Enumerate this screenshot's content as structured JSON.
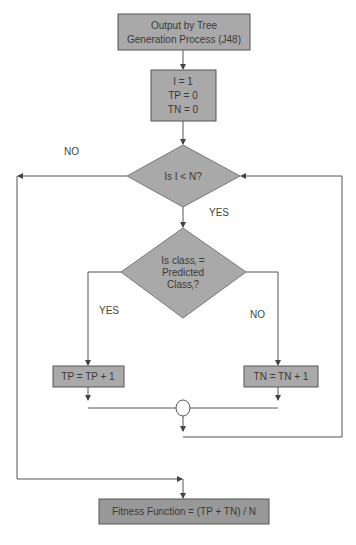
{
  "diagram": {
    "type": "flowchart",
    "colors": {
      "box_fill": "#a9a9a9",
      "box_stroke": "#555555",
      "line": "#555555",
      "text": "#3a3a3a",
      "background": "#ffffff"
    },
    "nodes": {
      "start": {
        "shape": "rectangle",
        "lines": [
          "Output by Tree",
          "Generation Process (J48)"
        ]
      },
      "init": {
        "shape": "rectangle",
        "lines": [
          "I = 1",
          "TP = 0",
          "TN = 0"
        ]
      },
      "loop_check": {
        "shape": "diamond",
        "text": "Is I < N?"
      },
      "class_check": {
        "shape": "diamond",
        "line1_main": "Is class",
        "line1_sub": "i",
        "line1_tail": " =",
        "line2": "Predicted",
        "line3_main": "Class",
        "line3_sub": "i",
        "line3_tail": "?"
      },
      "tp_increment": {
        "shape": "rectangle",
        "text": "TP = TP + 1"
      },
      "tn_increment": {
        "shape": "rectangle",
        "text": "TN = TN + 1"
      },
      "merge": {
        "shape": "circle",
        "text": ""
      },
      "fitness": {
        "shape": "rectangle",
        "text": "Fitness Function = (TP + TN) / N"
      }
    },
    "edge_labels": {
      "loop_no": "NO",
      "loop_yes": "YES",
      "class_yes": "YES",
      "class_no": "NO"
    },
    "edges": [
      {
        "from": "start",
        "to": "init"
      },
      {
        "from": "init",
        "to": "loop_check"
      },
      {
        "from": "loop_check",
        "to": "class_check",
        "label": "YES"
      },
      {
        "from": "loop_check",
        "to": "fitness",
        "label": "NO"
      },
      {
        "from": "class_check",
        "to": "tp_increment",
        "label": "YES"
      },
      {
        "from": "class_check",
        "to": "tn_increment",
        "label": "NO"
      },
      {
        "from": "tp_increment",
        "to": "merge"
      },
      {
        "from": "tn_increment",
        "to": "merge"
      },
      {
        "from": "merge",
        "to": "loop_check"
      }
    ]
  }
}
